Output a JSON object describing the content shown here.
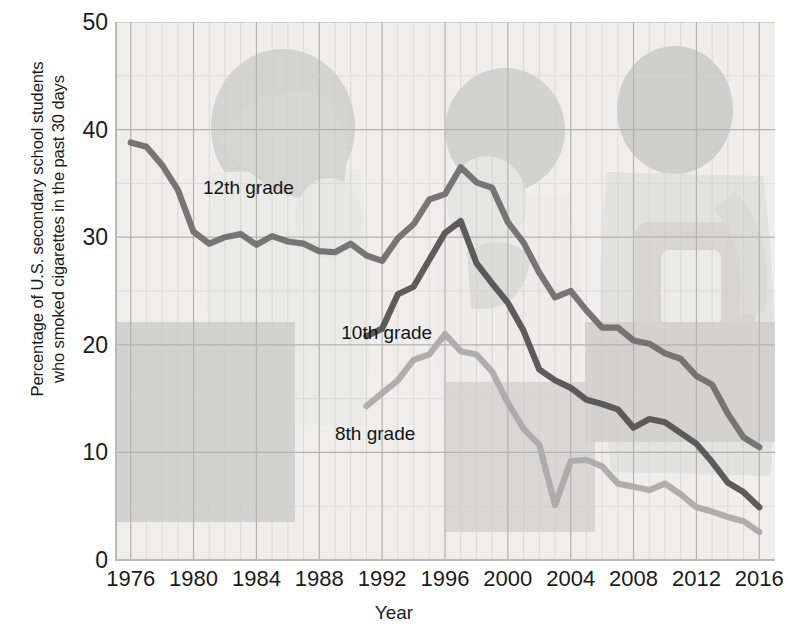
{
  "chart_data": {
    "type": "line",
    "title": "",
    "xlabel": "Year",
    "ylabel_line1": "Percentage of U.S. secondary school students",
    "ylabel_line2": "who smoked cigarettes in the past 30 days",
    "xlim": [
      1975,
      2017
    ],
    "ylim": [
      0,
      50
    ],
    "yticks": [
      0,
      10,
      20,
      30,
      40,
      50
    ],
    "xticks": [
      1976,
      1980,
      1984,
      1988,
      1992,
      1996,
      2000,
      2004,
      2008,
      2012,
      2016
    ],
    "grid": "major every 4 years and every 10 percent, minor every year",
    "legend": "inline annotations on plot",
    "background_image": "faded photograph of three secondary school students",
    "series": [
      {
        "name": "12th grade",
        "color": "#6b6b6b",
        "label_x": 1980.6,
        "label_y": 34.5,
        "x": [
          1976,
          1977,
          1978,
          1979,
          1980,
          1981,
          1982,
          1983,
          1984,
          1985,
          1986,
          1987,
          1988,
          1989,
          1990,
          1991,
          1992,
          1993,
          1994,
          1995,
          1996,
          1997,
          1998,
          1999,
          2000,
          2001,
          2002,
          2003,
          2004,
          2005,
          2006,
          2007,
          2008,
          2009,
          2010,
          2011,
          2012,
          2013,
          2014,
          2015,
          2016
        ],
        "y": [
          38.8,
          38.4,
          36.7,
          34.4,
          30.5,
          29.4,
          30.0,
          30.3,
          29.3,
          30.1,
          29.6,
          29.4,
          28.7,
          28.6,
          29.4,
          28.3,
          27.8,
          29.9,
          31.2,
          33.5,
          34.0,
          36.5,
          35.1,
          34.6,
          31.4,
          29.5,
          26.7,
          24.4,
          25.0,
          23.2,
          21.6,
          21.6,
          20.4,
          20.1,
          19.2,
          18.7,
          17.1,
          16.3,
          13.6,
          11.4,
          10.5
        ]
      },
      {
        "name": "10th grade",
        "color": "#4f4f4f",
        "label_x": 1989.4,
        "label_y": 21.0,
        "x": [
          1991,
          1992,
          1993,
          1994,
          1995,
          1996,
          1997,
          1998,
          1999,
          2000,
          2001,
          2002,
          2003,
          2004,
          2005,
          2006,
          2007,
          2008,
          2009,
          2010,
          2011,
          2012,
          2013,
          2014,
          2015,
          2016
        ],
        "y": [
          20.8,
          21.5,
          24.7,
          25.4,
          27.9,
          30.4,
          31.5,
          27.6,
          25.7,
          23.9,
          21.3,
          17.7,
          16.7,
          16.0,
          14.9,
          14.5,
          14.0,
          12.3,
          13.1,
          12.8,
          11.8,
          10.8,
          9.1,
          7.2,
          6.3,
          4.9
        ]
      },
      {
        "name": "8th grade",
        "color": "#a8a8a8",
        "label_x": 1989.0,
        "label_y": 11.6,
        "x": [
          1991,
          1992,
          1993,
          1994,
          1995,
          1996,
          1997,
          1998,
          1999,
          2000,
          2001,
          2002,
          2003,
          2004,
          2005,
          2006,
          2007,
          2008,
          2009,
          2010,
          2011,
          2012,
          2013,
          2014,
          2015,
          2016
        ],
        "y": [
          14.3,
          15.5,
          16.7,
          18.6,
          19.1,
          21.0,
          19.4,
          19.1,
          17.5,
          14.6,
          12.2,
          10.7,
          5.1,
          9.2,
          9.3,
          8.7,
          7.1,
          6.8,
          6.5,
          7.1,
          6.1,
          4.9,
          4.5,
          4.0,
          3.6,
          2.6
        ]
      }
    ]
  }
}
